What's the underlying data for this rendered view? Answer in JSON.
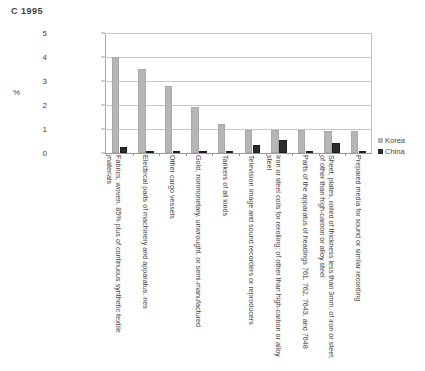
{
  "chart_data": {
    "type": "bar",
    "title": "C  1995",
    "xlabel": "",
    "ylabel": "%",
    "ylim": [
      0,
      5
    ],
    "yticks": [
      0,
      1,
      2,
      3,
      4,
      5
    ],
    "grid": true,
    "legend_position": "right",
    "categories": [
      "Fabrics, woven, 85% plus of continuous synthetic textile materials",
      "Electrical parts of machinery and apparatus, nes",
      "Other cargo vessels",
      "Gold, nonmonetary, unwrought, or semi-manufactured",
      "Tankers of all kinds",
      "Television image and sound recorders or reproducers",
      "Iron or steel coils for rerolling; of other than high-carbon or alloy steel",
      "Parts of the apparatus of headings 761, 762, 7643, and 7648",
      "Sheet, plates, rolled of thickness less than 3mm, of iron or steel; of other than high-carbon or alloy steel",
      "Prepared media for sound or similar recording"
    ],
    "series": [
      {
        "name": "Korea",
        "color": "#b6b6b6",
        "values": [
          4.0,
          3.5,
          2.8,
          1.9,
          1.2,
          0.95,
          0.95,
          0.95,
          0.9,
          0.9
        ]
      },
      {
        "name": "China",
        "color": "#2b2b2b",
        "values": [
          0.25,
          0.05,
          0.02,
          0.02,
          0.1,
          0.35,
          0.55,
          0.0,
          0.4,
          0.0
        ]
      }
    ]
  },
  "legend": {
    "items": [
      {
        "label": "Korea",
        "swatch": "swatch-korea"
      },
      {
        "label": "China",
        "swatch": "swatch-china"
      }
    ]
  }
}
